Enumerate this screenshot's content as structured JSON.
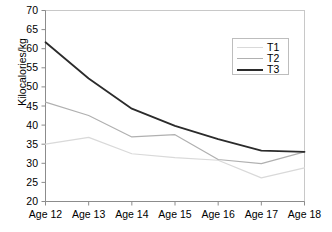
{
  "chart_data": {
    "type": "line",
    "title": "",
    "xlabel": "",
    "ylabel": "Kilocalories/kg",
    "categories": [
      "Age 12",
      "Age 13",
      "Age 14",
      "Age 15",
      "Age 16",
      "Age 17",
      "Age 18"
    ],
    "ylim": [
      20,
      70
    ],
    "yticks": [
      20,
      25,
      30,
      35,
      40,
      45,
      50,
      55,
      60,
      65,
      70
    ],
    "grid": false,
    "legend_position": "upper right",
    "series": [
      {
        "name": "T1",
        "color": "#d9d9d9",
        "width": 1.2,
        "values": [
          35.0,
          36.8,
          32.5,
          31.5,
          30.8,
          26.2,
          28.8
        ]
      },
      {
        "name": "T2",
        "color": "#b0b0b0",
        "width": 1.2,
        "values": [
          46.0,
          42.5,
          36.9,
          37.5,
          31.0,
          29.9,
          33.0
        ]
      },
      {
        "name": "T3",
        "color": "#2b2b2b",
        "width": 1.8,
        "values": [
          61.7,
          52.2,
          44.3,
          39.8,
          36.3,
          33.3,
          33.0
        ]
      }
    ]
  },
  "axes": {
    "y_tick_labels": [
      "70",
      "65",
      "60",
      "55",
      "50",
      "45",
      "40",
      "35",
      "30",
      "25",
      "20"
    ],
    "y_axis_title": "Kilocalories/kg",
    "x_tick_labels": [
      "Age 12",
      "Age 13",
      "Age 14",
      "Age 15",
      "Age 16",
      "Age 17",
      "Age 18"
    ]
  },
  "legend": {
    "entries": [
      {
        "label": "T1"
      },
      {
        "label": "T2"
      },
      {
        "label": "T3"
      }
    ]
  },
  "colors": {
    "plot_border": "#c8c8c8",
    "axis": "#8c8c8c",
    "background": "#ffffff",
    "series_t1": "#d9d9d9",
    "series_t2": "#b0b0b0",
    "series_t3": "#2b2b2b"
  }
}
